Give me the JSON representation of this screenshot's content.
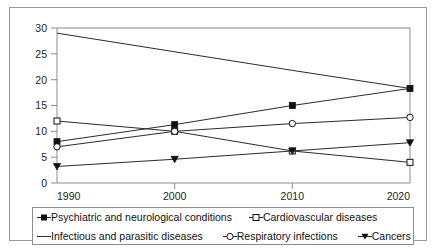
{
  "chart_data": {
    "type": "line",
    "title": "",
    "xlabel": "",
    "ylabel": "",
    "x": [
      1990,
      2000,
      2010,
      2020
    ],
    "xticklabels": [
      "1990",
      "2000",
      "2010",
      "2020"
    ],
    "yticklabels": [
      "0",
      "5",
      "10",
      "15",
      "20",
      "25",
      "30"
    ],
    "yticks": [
      0,
      5,
      10,
      15,
      20,
      25,
      30
    ],
    "xlim": [
      1990,
      2020
    ],
    "ylim": [
      0,
      30
    ],
    "grid": false,
    "legend_position": "bottom",
    "series": [
      {
        "name": "Psychiatric and neurological conditions",
        "marker": "filled-square",
        "values": [
          8.0,
          11.3,
          15.0,
          18.3
        ]
      },
      {
        "name": "Cardiovascular diseases",
        "marker": "open-square",
        "values": [
          12.0,
          10.0,
          6.2,
          4.0
        ]
      },
      {
        "name": "Infectious and parasitic diseases",
        "marker": "none",
        "values": [
          29.0,
          25.4,
          21.8,
          18.3
        ]
      },
      {
        "name": "Respiratory infections",
        "marker": "open-circle",
        "values": [
          7.0,
          10.0,
          11.5,
          12.7
        ]
      },
      {
        "name": "Cancers",
        "marker": "filled-triangle-down",
        "values": [
          3.2,
          4.6,
          6.2,
          7.8
        ]
      }
    ]
  },
  "legend": {
    "row1": [
      {
        "label": "Psychiatric and neurological conditions",
        "marker": "filled-square"
      },
      {
        "label": "Cardiovascular diseases",
        "marker": "open-square"
      }
    ],
    "row2": [
      {
        "label": "Infectious and parasitic diseases",
        "marker": "line"
      },
      {
        "label": "Respiratory infections",
        "marker": "open-circle"
      },
      {
        "label": "Cancers",
        "marker": "filled-triangle-down"
      }
    ]
  },
  "colors": {
    "line": "#2b2b2b",
    "axis": "#8d8d8d",
    "frame": "#9a9a9a",
    "text": "#1a1a1a",
    "background": "#ffffff"
  }
}
